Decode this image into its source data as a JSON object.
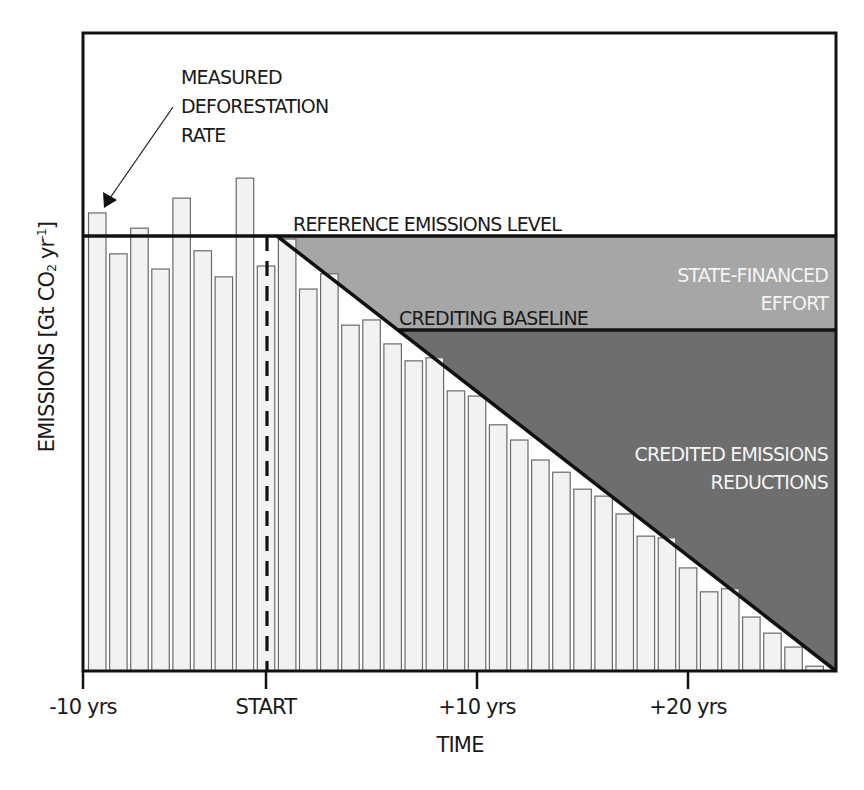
{
  "chart_data": {
    "type": "bar",
    "title": "",
    "xlabel": "TIME",
    "ylabel": "EMISSIONS [Gt CO2 yr-1]",
    "ylabel_parts": {
      "main": "EMISSIONS [Gt CO",
      "sub": "2",
      "mid": " yr",
      "sup": "-1",
      "end": "]"
    },
    "x_ticks": [
      {
        "label": "-10 yrs",
        "x_px": 83
      },
      {
        "label": "START",
        "x_px": 266
      },
      {
        "label": "+10 yrs",
        "x_px": 477
      },
      {
        "label": "+20 yrs",
        "x_px": 688
      }
    ],
    "units_note": "Relative emissions; reference emissions level = 100, axis bottom = 0",
    "ylim": [
      0,
      135
    ],
    "grid": false,
    "series": [
      {
        "name": "Measured deforestation rate",
        "values": [
          105.3,
          95.9,
          101.8,
          92.4,
          108.7,
          96.6,
          90.6,
          113.3,
          93.1,
          99.3,
          87.8,
          91.3,
          79.5,
          80.7,
          75.2,
          71.3,
          72.0,
          64.4,
          63.2,
          56.6,
          53.1,
          48.5,
          45.7,
          41.8,
          40.2,
          36.1,
          31.0,
          30.6,
          23.7,
          18.2,
          18.9,
          12.4,
          8.7,
          5.5,
          1.1
        ]
      }
    ],
    "reference_emissions_level": 100,
    "crediting_baseline": 78.4,
    "start_bar_index": 8,
    "decline_line": {
      "from_bar_index": 9,
      "from_value": 100,
      "to": "end of period",
      "to_value": 0
    },
    "annotations": [
      {
        "text": "MEASURED DEFORESTATION RATE",
        "lines": [
          "MEASURED",
          "DEFORESTATION",
          "RATE"
        ],
        "arrow_to_bar": 0
      },
      {
        "text": "REFERENCE EMISSIONS LEVEL"
      },
      {
        "text": "CREDITING BASELINE"
      },
      {
        "text": "STATE-FINANCED EFFORT",
        "lines": [
          "STATE-FINANCED",
          "EFFORT"
        ],
        "region_color": "#a6a6a6"
      },
      {
        "text": "CREDITED EMISSIONS REDUCTIONS",
        "lines": [
          "CREDITED EMISSIONS",
          "REDUCTIONS"
        ],
        "region_color": "#6e6e6e"
      }
    ]
  },
  "colors": {
    "bar_fill": "#f2f2f2",
    "bar_stroke": "#6a6a6a",
    "state_financed_region": "#a6a6a6",
    "credited_region": "#6e6e6e",
    "lines": "#111111",
    "region_text": "#f4f4f4"
  }
}
